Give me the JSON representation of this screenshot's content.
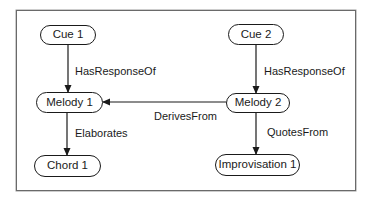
{
  "diagram": {
    "type": "directed-graph",
    "nodes": {
      "cue1": {
        "label": "Cue 1"
      },
      "cue2": {
        "label": "Cue 2"
      },
      "melody1": {
        "label": "Melody 1"
      },
      "melody2": {
        "label": "Melody 2"
      },
      "chord1": {
        "label": "Chord 1"
      },
      "improvisation1": {
        "label": "Improvisation 1"
      }
    },
    "edges": {
      "cue1_melody1": {
        "from": "Cue 1",
        "to": "Melody 1",
        "label": "HasResponseOf"
      },
      "cue2_melody2": {
        "from": "Cue 2",
        "to": "Melody 2",
        "label": "HasResponseOf"
      },
      "melody2_melody1": {
        "from": "Melody 2",
        "to": "Melody 1",
        "label": "DerivesFrom"
      },
      "melody1_chord1": {
        "from": "Melody 1",
        "to": "Chord 1",
        "label": "Elaborates"
      },
      "melody2_improvisation1": {
        "from": "Melody 2",
        "to": "Improvisation 1",
        "label": "QuotesFrom"
      }
    },
    "colors": {
      "stroke": "#1a1a1a",
      "frame": "#6a6a6a",
      "background": "#ffffff"
    }
  }
}
